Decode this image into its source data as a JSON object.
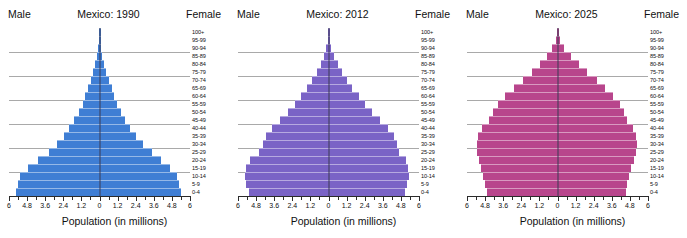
{
  "chart_data": {
    "type": "bar",
    "chart_kind": "population-pyramid",
    "axis_title": "Population (in millions)",
    "xlabel": "Population (in millions)",
    "ylabel": "",
    "xlim": [
      -6,
      6
    ],
    "xtick_labels": [
      "6",
      "4.8",
      "3.6",
      "2.4",
      "1.2",
      "0",
      "1.2",
      "2.4",
      "3.6",
      "4.8",
      "6"
    ],
    "xtick_values": [
      -6,
      -4.8,
      -3.6,
      -2.4,
      -1.2,
      0,
      1.2,
      2.4,
      3.6,
      4.8,
      6
    ],
    "xtick_step": 1.2,
    "minor_tick_step": 0.6,
    "grid": true,
    "grid_axis": "y",
    "grid_every_n_bands": 3,
    "legend": "none",
    "left_side_label": "Male",
    "right_side_label": "Female",
    "age_groups": [
      "0-4",
      "5-9",
      "10-14",
      "15-19",
      "20-24",
      "25-29",
      "30-34",
      "35-39",
      "40-44",
      "45-49",
      "50-54",
      "55-59",
      "60-64",
      "65-69",
      "70-74",
      "75-79",
      "80-84",
      "85-89",
      "90-94",
      "95-99",
      "100+"
    ],
    "panels": [
      {
        "title": "Mexico: 1990",
        "year": "1990",
        "color": "#3f7ed4",
        "male": [
          5.55,
          5.42,
          5.3,
          4.72,
          4.05,
          3.36,
          2.8,
          2.38,
          1.99,
          1.66,
          1.38,
          1.12,
          0.93,
          0.74,
          0.57,
          0.41,
          0.27,
          0.15,
          0.07,
          0.025,
          0.008
        ],
        "female": [
          5.38,
          5.27,
          5.15,
          4.66,
          4.1,
          3.45,
          2.88,
          2.45,
          2.05,
          1.72,
          1.44,
          1.18,
          0.99,
          0.8,
          0.62,
          0.45,
          0.31,
          0.17,
          0.08,
          0.03,
          0.01
        ]
      },
      {
        "title": "Mexico: 2012",
        "year": "2012",
        "color": "#7a63c6",
        "male": [
          5.28,
          5.44,
          5.52,
          5.46,
          5.18,
          4.61,
          4.35,
          4.12,
          3.72,
          3.22,
          2.7,
          2.22,
          1.8,
          1.42,
          1.09,
          0.77,
          0.5,
          0.29,
          0.14,
          0.05,
          0.012
        ],
        "female": [
          5.07,
          5.23,
          5.32,
          5.3,
          5.14,
          4.7,
          4.52,
          4.33,
          3.93,
          3.42,
          2.9,
          2.42,
          1.99,
          1.59,
          1.25,
          0.92,
          0.62,
          0.37,
          0.18,
          0.07,
          0.016
        ]
      },
      {
        "title": "Mexico: 2025",
        "year": "2025",
        "color": "#b8458c",
        "male": [
          4.7,
          4.8,
          4.92,
          5.06,
          5.22,
          5.32,
          5.36,
          5.26,
          4.98,
          4.55,
          4.26,
          3.95,
          3.45,
          2.9,
          2.32,
          1.72,
          1.18,
          0.7,
          0.34,
          0.12,
          0.028
        ],
        "female": [
          4.52,
          4.62,
          4.74,
          4.88,
          5.05,
          5.2,
          5.28,
          5.22,
          4.98,
          4.62,
          4.4,
          4.15,
          3.7,
          3.16,
          2.59,
          1.98,
          1.42,
          0.9,
          0.46,
          0.18,
          0.042
        ]
      }
    ]
  }
}
